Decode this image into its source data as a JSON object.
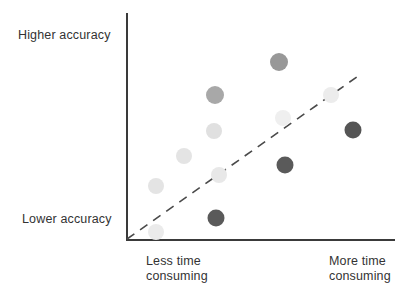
{
  "figure": {
    "width": 412,
    "height": 300,
    "background": "#ffffff"
  },
  "axes": {
    "color": "#3a3a3a",
    "y_axis_label_top": "Higher accuracy",
    "y_axis_label_bottom": "Lower accuracy",
    "x_axis_label_left": "Less time\nconsuming",
    "x_axis_label_right": "More time\nconsuming"
  },
  "trendline": {
    "style": "dashed",
    "color": "#4a4a4a",
    "dash_pattern": "9 7",
    "width": 1.6,
    "x1": 127,
    "y1": 239,
    "x2": 361,
    "y2": 74
  },
  "chart_data": {
    "type": "scatter",
    "title": "",
    "subtitle": "",
    "xlabel": "Less time consuming → More time consuming",
    "ylabel": "Lower accuracy → Higher accuracy",
    "xlim": [
      0,
      1
    ],
    "ylim": [
      0,
      1
    ],
    "grid": false,
    "legend": "none",
    "axis_tick_labels": {
      "x": [
        "Less time consuming",
        "More time consuming"
      ],
      "y": [
        "Lower accuracy",
        "Higher accuracy"
      ]
    },
    "annotations": [
      {
        "type": "trendline",
        "description": "dashed diagonal reference line rising left to right",
        "from": [
          0.0,
          0.0
        ],
        "to": [
          0.87,
          0.73
        ]
      }
    ],
    "series": [
      {
        "name": "methods",
        "marker": "circle",
        "points": [
          {
            "label": "p1",
            "x": 0.111,
            "y": 0.035,
            "px": 156,
            "py": 232,
            "r": 8,
            "color": "#ebebeb",
            "shade": "very-light"
          },
          {
            "label": "p2",
            "x": 0.111,
            "y": 0.238,
            "px": 156,
            "py": 186,
            "r": 8,
            "color": "#e4e4e4",
            "shade": "very-light"
          },
          {
            "label": "p3",
            "x": 0.216,
            "y": 0.37,
            "px": 184,
            "py": 156,
            "r": 8,
            "color": "#e4e4e4",
            "shade": "light"
          },
          {
            "label": "p4",
            "x": 0.327,
            "y": 0.48,
            "px": 214,
            "py": 131,
            "r": 8,
            "color": "#e0e0e0",
            "shade": "light"
          },
          {
            "label": "p5",
            "x": 0.331,
            "y": 0.639,
            "px": 215,
            "py": 95,
            "r": 9,
            "color": "#a8a8a8",
            "shade": "medium"
          },
          {
            "label": "p6",
            "x": 0.335,
            "y": 0.097,
            "px": 216,
            "py": 218,
            "r": 8.5,
            "color": "#5a5a5a",
            "shade": "dark"
          },
          {
            "label": "p7",
            "x": 0.346,
            "y": 0.286,
            "px": 219,
            "py": 175,
            "r": 8,
            "color": "#e8e8e8",
            "shade": "very-light"
          },
          {
            "label": "p8",
            "x": 0.569,
            "y": 0.784,
            "px": 279,
            "py": 62,
            "r": 9,
            "color": "#989898",
            "shade": "medium"
          },
          {
            "label": "p9",
            "x": 0.584,
            "y": 0.537,
            "px": 283,
            "py": 118,
            "r": 8,
            "color": "#efefef",
            "shade": "very-light"
          },
          {
            "label": "p10",
            "x": 0.591,
            "y": 0.33,
            "px": 285,
            "py": 165,
            "r": 8.5,
            "color": "#5a5a5a",
            "shade": "dark"
          },
          {
            "label": "p11",
            "x": 0.762,
            "y": 0.639,
            "px": 331,
            "py": 95,
            "r": 8,
            "color": "#ececec",
            "shade": "very-light"
          },
          {
            "label": "p12",
            "x": 0.844,
            "y": 0.485,
            "px": 353,
            "py": 130,
            "r": 8.5,
            "color": "#555555",
            "shade": "dark"
          }
        ]
      }
    ]
  }
}
